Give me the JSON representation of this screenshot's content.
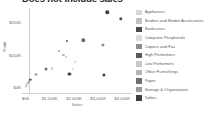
{
  "chart": {
    "title": "Does not include sales",
    "type_label": "scatter-plot"
  },
  "axes": {
    "x": {
      "title": "Sales",
      "ticks": [
        "$0K",
        "$1,000K",
        "$2,000K",
        "$3,000K",
        "$4,000K"
      ],
      "tick_values": [
        0,
        1000,
        2000,
        3000,
        4000
      ]
    },
    "y": {
      "title": "Profit",
      "ticks": [
        "$0K",
        "$100K",
        "$200K"
      ],
      "tick_values": [
        0,
        100,
        200
      ]
    }
  },
  "legend": {
    "items": [
      {
        "label": "Appliances",
        "color": "#d7d7d7"
      },
      {
        "label": "Binders and Binder Accessories",
        "color": "#c3c3c3"
      },
      {
        "label": "Bookcases",
        "color": "#4a4a4a"
      },
      {
        "label": "Computer Peripherals",
        "color": "#dcdcdc"
      },
      {
        "label": "Copiers and Fax",
        "color": "#8f8f8f"
      },
      {
        "label": "High Performers",
        "color": "#5a5a5a"
      },
      {
        "label": "Low Performers",
        "color": "#c8c8c8"
      },
      {
        "label": "Office Furnishings",
        "color": "#b5b5b5"
      },
      {
        "label": "Paper",
        "color": "#6e6e6e"
      },
      {
        "label": "Storage & Organization",
        "color": "#9b9b9b"
      },
      {
        "label": "Tables",
        "color": "#3f3f3f"
      }
    ]
  },
  "chart_data": {
    "type": "scatter",
    "title": "Does not include sales",
    "xlabel": "Sales",
    "ylabel": "Profit",
    "xlim": [
      -150,
      4400
    ],
    "ylim": [
      -20,
      245
    ],
    "grid": false,
    "legend_position": "right",
    "points": [
      {
        "label": "Tables",
        "x": 3380,
        "y": 232,
        "color": "#3f3f3f",
        "size": 3.4
      },
      {
        "label": "Bookcases",
        "x": 3930,
        "y": 212,
        "color": "#4a4a4a",
        "size": 3.4
      },
      {
        "label": "Copiers and Fax",
        "x": 3190,
        "y": 131,
        "color": "#8f8f8f",
        "size": 3.2
      },
      {
        "label": "Paper",
        "x": 2390,
        "y": 146,
        "color": "#6e6e6e",
        "size": 3.4
      },
      {
        "label": "High Performers",
        "x": 1700,
        "y": 143,
        "color": "#5a5a5a",
        "size": 2.2
      },
      {
        "label": "Storage & Organization",
        "x": 1360,
        "y": 113,
        "color": "#9b9b9b",
        "size": 2.2
      },
      {
        "label": "Office Furnishings",
        "x": 1560,
        "y": 100,
        "color": "#b5b5b5",
        "size": 2.2
      },
      {
        "label": "Binders and Binder Accessories",
        "x": 1670,
        "y": 95,
        "color": "#c3c3c3",
        "size": 2.2
      },
      {
        "label": "Computer Peripherals",
        "x": 2060,
        "y": 80,
        "color": "#dcdcdc",
        "size": 2.4
      },
      {
        "label": "Appliances",
        "x": 1960,
        "y": 57,
        "color": "#d7d7d7",
        "size": 2.4
      },
      {
        "label": "Low Performers",
        "x": 1090,
        "y": 59,
        "color": "#c8c8c8",
        "size": 2.2
      },
      {
        "label": "Bookcases",
        "x": 1810,
        "y": 41,
        "color": "#4a4a4a",
        "size": 3.2
      },
      {
        "label": "Tables",
        "x": 3240,
        "y": 40,
        "color": "#3f3f3f",
        "size": 3.2
      },
      {
        "label": "Paper",
        "x": 830,
        "y": 57,
        "color": "#6e6e6e",
        "size": 3.0
      },
      {
        "label": "Copiers and Fax",
        "x": 420,
        "y": 40,
        "color": "#8f8f8f",
        "size": 2.8
      },
      {
        "label": "High Performers",
        "x": 190,
        "y": 23,
        "color": "#5a5a5a",
        "size": 2.4
      },
      {
        "label": "Storage & Organization",
        "x": 120,
        "y": 17,
        "color": "#9b9b9b",
        "size": 2.6
      },
      {
        "label": "Office Furnishings",
        "x": 60,
        "y": 12,
        "color": "#b5b5b5",
        "size": 2.4
      },
      {
        "label": "Low Performers",
        "x": 30,
        "y": 6,
        "color": "#c8c8c8",
        "size": 2.6
      },
      {
        "label": "Appliances",
        "x": 10,
        "y": 2,
        "color": "#d7d7d7",
        "size": 2.4
      }
    ]
  }
}
